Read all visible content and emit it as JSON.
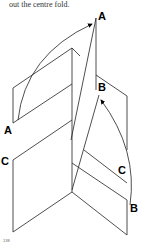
{
  "caption": "out the centre fold.",
  "page_number": "138",
  "labels": {
    "a_top": "A",
    "a_left": "A",
    "b_top": "B",
    "b_bottom": "B",
    "c_left": "C",
    "c_right": "C"
  }
}
